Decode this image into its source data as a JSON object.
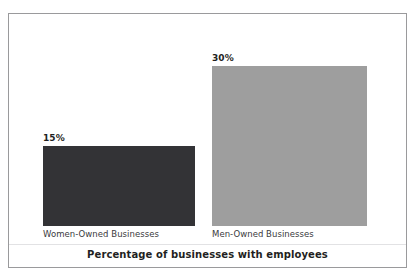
{
  "chart_data": {
    "type": "bar",
    "title": "Percentage of businesses with employees",
    "xlabel": "",
    "ylabel": "",
    "ylim": [
      0,
      30
    ],
    "grid": false,
    "legend": "none",
    "orientation": "vertical",
    "categories": [
      "Women-Owned Businesses",
      "Men-Owned Businesses"
    ],
    "values": [
      15,
      30
    ],
    "value_labels": [
      "15%",
      "30%"
    ],
    "bar_colors": [
      "#333336",
      "#9e9e9e"
    ],
    "bars": [
      {
        "category": "Women-Owned Businesses",
        "value": 15,
        "value_label": "15%",
        "color": "#333336"
      },
      {
        "category": "Men-Owned Businesses",
        "value": 30,
        "value_label": "30%",
        "color": "#9e9e9e"
      }
    ]
  },
  "figure": {
    "border_color": "#9a9a9c",
    "background": "#ffffff"
  }
}
